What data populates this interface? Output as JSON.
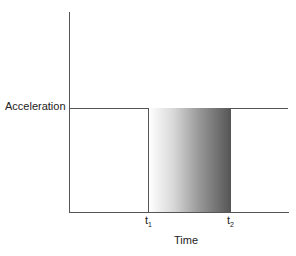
{
  "chart_data": {
    "type": "area",
    "title": "",
    "xlabel": "Time",
    "ylabel": "Acceleration",
    "x_ticks": [
      "t1",
      "t2"
    ],
    "series": [
      {
        "name": "Acceleration pulse",
        "x": [
          "0",
          "t1",
          "t1",
          "t2",
          "t2",
          "end"
        ],
        "values": [
          0,
          0,
          1,
          1,
          0,
          0
        ]
      }
    ],
    "reference_lines": [
      {
        "axis": "y",
        "label": "Acceleration",
        "value": 1
      }
    ],
    "grid": false,
    "legend": null
  },
  "labels": {
    "ylabel": "Acceleration",
    "xlabel": "Time",
    "t1_main": "t",
    "t1_sub": "1",
    "t2_main": "t",
    "t2_sub": "2"
  }
}
